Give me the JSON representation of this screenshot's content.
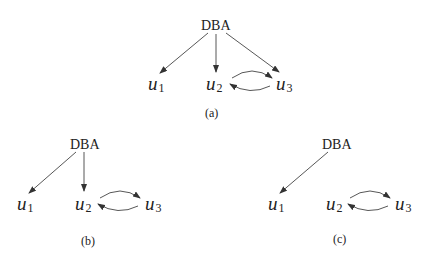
{
  "diagrams": [
    {
      "id": "a",
      "caption": "(a)",
      "root": "DBA",
      "nodes": [
        {
          "base": "u",
          "sub": "1"
        },
        {
          "base": "u",
          "sub": "2"
        },
        {
          "base": "u",
          "sub": "3"
        }
      ],
      "edges": [
        {
          "from": "DBA",
          "to": "u1"
        },
        {
          "from": "DBA",
          "to": "u2"
        },
        {
          "from": "DBA",
          "to": "u3"
        },
        {
          "from": "u2",
          "to": "u3"
        },
        {
          "from": "u3",
          "to": "u2"
        }
      ]
    },
    {
      "id": "b",
      "caption": "(b)",
      "root": "DBA",
      "nodes": [
        {
          "base": "u",
          "sub": "1"
        },
        {
          "base": "u",
          "sub": "2"
        },
        {
          "base": "u",
          "sub": "3"
        }
      ],
      "edges": [
        {
          "from": "DBA",
          "to": "u1"
        },
        {
          "from": "DBA",
          "to": "u2"
        },
        {
          "from": "u2",
          "to": "u3"
        },
        {
          "from": "u3",
          "to": "u2"
        }
      ]
    },
    {
      "id": "c",
      "caption": "(c)",
      "root": "DBA",
      "nodes": [
        {
          "base": "u",
          "sub": "1"
        },
        {
          "base": "u",
          "sub": "2"
        },
        {
          "base": "u",
          "sub": "3"
        }
      ],
      "edges": [
        {
          "from": "DBA",
          "to": "u1"
        },
        {
          "from": "u2",
          "to": "u3"
        },
        {
          "from": "u3",
          "to": "u2"
        }
      ]
    }
  ],
  "colors": {
    "line": "#333333",
    "text": "#222222",
    "background": "#ffffff"
  }
}
